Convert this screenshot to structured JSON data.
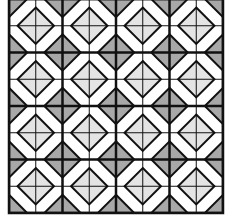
{
  "pattern": {
    "type": "geometric-tiling",
    "rows": 4,
    "cols": 4,
    "origin_x": 9,
    "origin_y": -1,
    "cell_size": 53.5,
    "colors": {
      "background": "#ffffff",
      "line": "#111111",
      "light_diamond": "#e4e4e4",
      "dark_diamond": "#a8a8a8"
    }
  }
}
